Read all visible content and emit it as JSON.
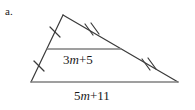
{
  "figure": {
    "problem_label": "a.",
    "shape": "triangle",
    "midsegment_label": {
      "full": "3m + 5",
      "coefficient": "3",
      "variable": "m",
      "operator": "+",
      "constant": "5"
    },
    "base_label": {
      "full": "5m + 11",
      "coefficient": "5",
      "variable": "m",
      "operator": "+",
      "constant": "11"
    },
    "vertices": {
      "apex": [
        63,
        15
      ],
      "bottom_left": [
        31,
        82
      ],
      "bottom_right": [
        178,
        82
      ]
    },
    "midpoints": {
      "left_side": [
        47,
        49
      ],
      "right_side": [
        121,
        49
      ]
    },
    "tick_marks": {
      "left_side_upper": {
        "count": 1,
        "at": [
          55,
          32
        ]
      },
      "left_side_lower": {
        "count": 1,
        "at": [
          39,
          66
        ]
      },
      "right_side_upper": {
        "count": 2,
        "at": [
          92,
          32
        ]
      },
      "right_side_lower": {
        "count": 2,
        "at": [
          149,
          66
        ]
      }
    },
    "colors": {
      "base_line": "#808080",
      "midsegment_line": "#808080",
      "slanted_sides": "#3a3a3a",
      "tick_marks": "#3a3a3a",
      "text": "#1a1a1a",
      "background": "#ffffff"
    }
  }
}
